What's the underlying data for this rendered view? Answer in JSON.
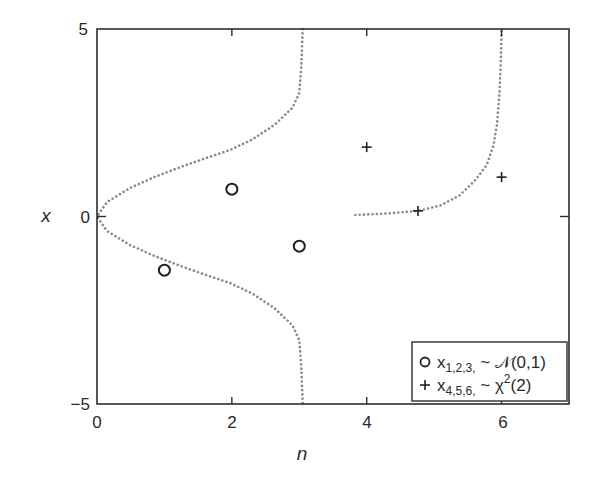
{
  "chart_data": {
    "type": "scatter",
    "title": "",
    "xlabel": "n",
    "ylabel": "x",
    "xlim": [
      0,
      7
    ],
    "ylim": [
      -5,
      5
    ],
    "xticks": [
      0,
      2,
      4,
      6
    ],
    "yticks": [
      -5,
      0,
      5
    ],
    "grid": false,
    "legend_position": "lower right",
    "series": [
      {
        "name": "x_{1,2,3,} ~ N(0,1)",
        "marker": "circle",
        "x": [
          1,
          2,
          3
        ],
        "y": [
          -1.43,
          0.73,
          -0.79
        ]
      },
      {
        "name": "x_{4,5,6,} ~ χ²(2)",
        "marker": "plus",
        "x": [
          4,
          4.76,
          6
        ],
        "y": [
          1.85,
          0.15,
          1.05
        ]
      }
    ],
    "curves": [
      {
        "name": "N(0,1) density (rotated, dotted)",
        "style": "dotted",
        "points": [
          [
            3.05,
            5
          ],
          [
            3.03,
            4
          ],
          [
            3.0,
            3.3
          ],
          [
            2.9,
            2.9
          ],
          [
            2.63,
            2.44
          ],
          [
            2.3,
            2.05
          ],
          [
            1.97,
            1.77
          ],
          [
            1.6,
            1.55
          ],
          [
            1.24,
            1.32
          ],
          [
            0.85,
            1.05
          ],
          [
            0.49,
            0.76
          ],
          [
            0.15,
            0.39
          ],
          [
            0,
            0
          ],
          [
            0.15,
            -0.39
          ],
          [
            0.49,
            -0.76
          ],
          [
            0.85,
            -1.05
          ],
          [
            1.24,
            -1.32
          ],
          [
            1.6,
            -1.55
          ],
          [
            1.97,
            -1.77
          ],
          [
            2.3,
            -2.05
          ],
          [
            2.63,
            -2.44
          ],
          [
            2.9,
            -2.9
          ],
          [
            3.0,
            -3.3
          ],
          [
            3.03,
            -4
          ],
          [
            3.05,
            -5
          ]
        ]
      },
      {
        "name": "χ²(2) density (rotated, dotted)",
        "style": "dotted",
        "points": [
          [
            3.83,
            0.04
          ],
          [
            4.3,
            0.08
          ],
          [
            4.76,
            0.15
          ],
          [
            5.1,
            0.3
          ],
          [
            5.38,
            0.57
          ],
          [
            5.6,
            0.95
          ],
          [
            5.78,
            1.37
          ],
          [
            5.88,
            1.9
          ],
          [
            5.93,
            2.44
          ],
          [
            5.97,
            3.3
          ],
          [
            5.99,
            4.2
          ],
          [
            6.0,
            5
          ]
        ]
      }
    ]
  },
  "legend": {
    "entries": [
      {
        "symbol": "○",
        "var": "x",
        "sub": "1,2,3,",
        "dist": " ~ 𝒩(0,1)"
      },
      {
        "symbol": "+",
        "var": "x",
        "sub": "4,5,6,",
        "dist": " ~ χ",
        "sup": "2",
        "tail": "(2)"
      }
    ]
  },
  "axes": {
    "xlabel": "n",
    "ylabel": "x",
    "xtick_labels": [
      "0",
      "2",
      "4",
      "6"
    ],
    "ytick_labels": [
      "5",
      "0",
      "−5"
    ]
  },
  "colors": {
    "axis": "#2e2e2e",
    "marker": "#222222",
    "curve": "#8a8a8a"
  }
}
